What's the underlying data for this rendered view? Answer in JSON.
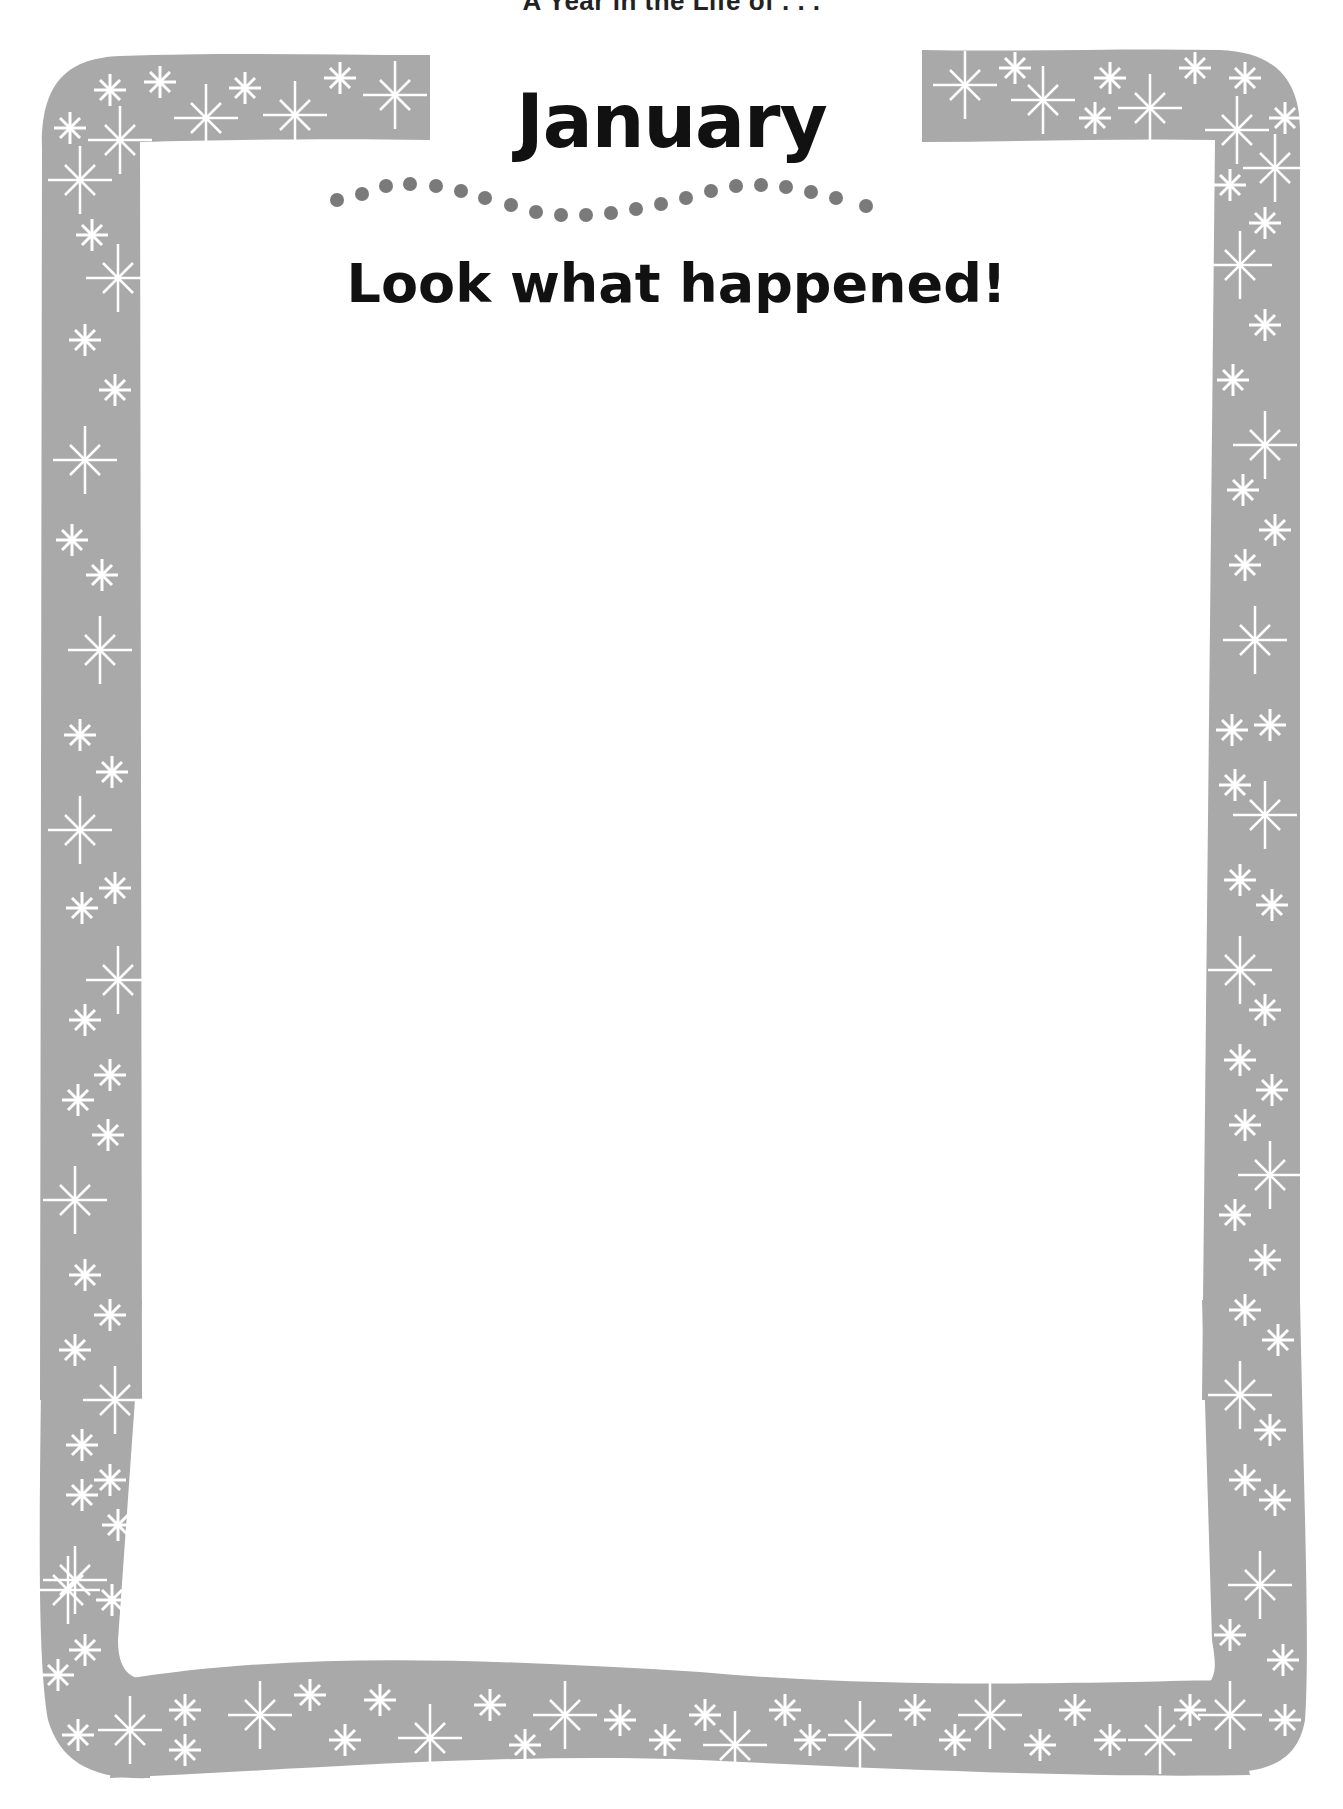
{
  "page": {
    "running_head": "A Year in the Life of . . .",
    "month": "January",
    "prompt": "Look what happened!"
  },
  "decoration": {
    "border_color": "#a9a9a9",
    "sparkle_color": "#ffffff",
    "dot_color": "#7a7a7a",
    "dot_count": 22,
    "sparkle_icon": "sparkle-star-icon"
  }
}
